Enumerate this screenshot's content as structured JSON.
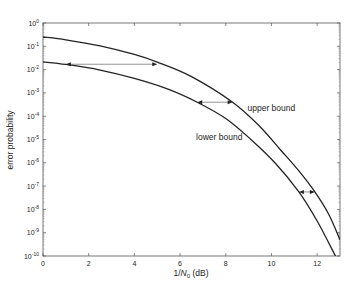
{
  "chart_data": {
    "type": "line",
    "title": "",
    "xlabel": "1/N",
    "xlabel_sub": "0",
    "xlabel_suffix": " (dB)",
    "ylabel": "error probability",
    "xlim": [
      0,
      13
    ],
    "ylim": [
      1e-10,
      1
    ],
    "yscale": "log",
    "grid": false,
    "x_ticks": [
      0,
      2,
      4,
      6,
      8,
      10,
      12
    ],
    "x_tick_labels": [
      "0",
      "2",
      "4",
      "6",
      "8",
      "10",
      "12"
    ],
    "y_ticks_exp": [
      0,
      -1,
      -2,
      -3,
      -4,
      -5,
      -6,
      -7,
      -8,
      -9,
      -10
    ],
    "series": [
      {
        "name": "upper bound",
        "x": [
          0,
          1,
          2.5,
          4,
          5,
          6.5,
          8.3,
          9.5,
          10.4,
          11.2,
          11.9,
          12.5,
          13
        ],
        "log10_y": [
          -0.6,
          -0.72,
          -0.98,
          -1.35,
          -1.68,
          -2.3,
          -3.4,
          -4.45,
          -5.45,
          -6.35,
          -7.25,
          -8.2,
          -9.3
        ]
      },
      {
        "name": "lower bound",
        "x": [
          0,
          1,
          2.5,
          4,
          5.5,
          6.75,
          8,
          9.1,
          10.2,
          11.2,
          12,
          12.8
        ],
        "log10_y": [
          -1.67,
          -1.78,
          -2.02,
          -2.38,
          -2.85,
          -3.4,
          -4.1,
          -5.0,
          -6.05,
          -7.25,
          -8.5,
          -10.0
        ]
      }
    ],
    "annotations": [
      {
        "text": "upper bound",
        "x": 8.95,
        "log10_y": -3.65
      },
      {
        "text": "lower bound",
        "x": 6.7,
        "log10_y": -4.9
      }
    ],
    "arrows": [
      {
        "x1": 1.0,
        "x2": 5.0,
        "log10_y": -1.77
      },
      {
        "x1": 6.75,
        "x2": 8.3,
        "log10_y": -3.4
      },
      {
        "x1": 11.2,
        "x2": 11.9,
        "log10_y": -7.25
      }
    ]
  }
}
